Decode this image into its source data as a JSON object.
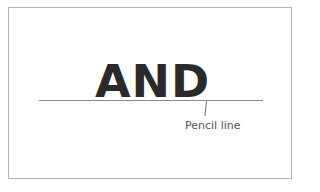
{
  "diagram": {
    "word": "AND",
    "annotation": {
      "label": "Pencil line"
    },
    "colors": {
      "border": "#b4b4b4",
      "word": "#2a2a2a",
      "line": "#8c8c8c",
      "label": "#555555",
      "background": "#ffffff"
    }
  }
}
